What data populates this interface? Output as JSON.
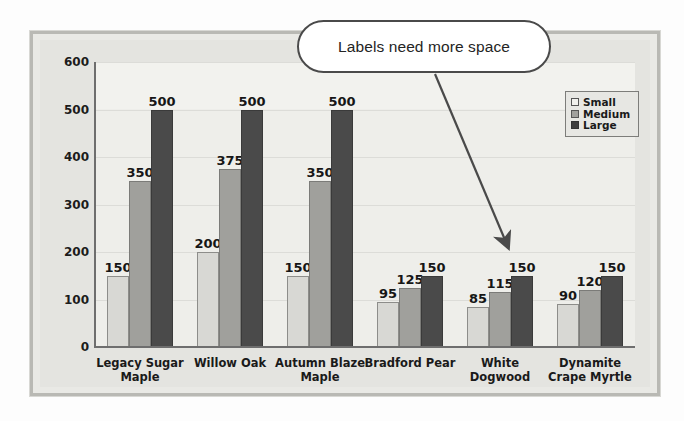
{
  "callout": {
    "text": "Labels need more space",
    "arrow_from": [
      435,
      74
    ],
    "arrow_to": [
      508,
      247
    ]
  },
  "legend": {
    "items": [
      {
        "label": "Small",
        "color": "#f0f0ec"
      },
      {
        "label": "Medium",
        "color": "#a0a09c"
      },
      {
        "label": "Large",
        "color": "#3e3e3e"
      }
    ]
  },
  "axis": {
    "y_ticks": [
      "0",
      "100",
      "200",
      "300",
      "400",
      "500",
      "600"
    ]
  },
  "chart_data": {
    "type": "bar",
    "title": "",
    "xlabel": "",
    "ylabel": "",
    "ylim": [
      0,
      600
    ],
    "grid": true,
    "legend_position": "top-right",
    "categories": [
      "Legacy Sugar Maple",
      "Willow Oak",
      "Autumn Blaze Maple",
      "Bradford Pear",
      "White Dogwood",
      "Dynamite Crape Myrtle"
    ],
    "category_lines": [
      [
        "Legacy Sugar",
        "Maple"
      ],
      [
        "Willow Oak"
      ],
      [
        "Autumn Blaze",
        "Maple"
      ],
      [
        "Bradford Pear"
      ],
      [
        "White",
        "Dogwood"
      ],
      [
        "Dynamite",
        "Crape Myrtle"
      ]
    ],
    "series": [
      {
        "name": "Small",
        "color": "#d8d8d4",
        "values": [
          150,
          200,
          150,
          95,
          85,
          90
        ]
      },
      {
        "name": "Medium",
        "color": "#a0a09c",
        "values": [
          350,
          375,
          350,
          125,
          115,
          120
        ]
      },
      {
        "name": "Large",
        "color": "#4a4a4a",
        "values": [
          500,
          500,
          500,
          150,
          150,
          150
        ]
      }
    ]
  }
}
